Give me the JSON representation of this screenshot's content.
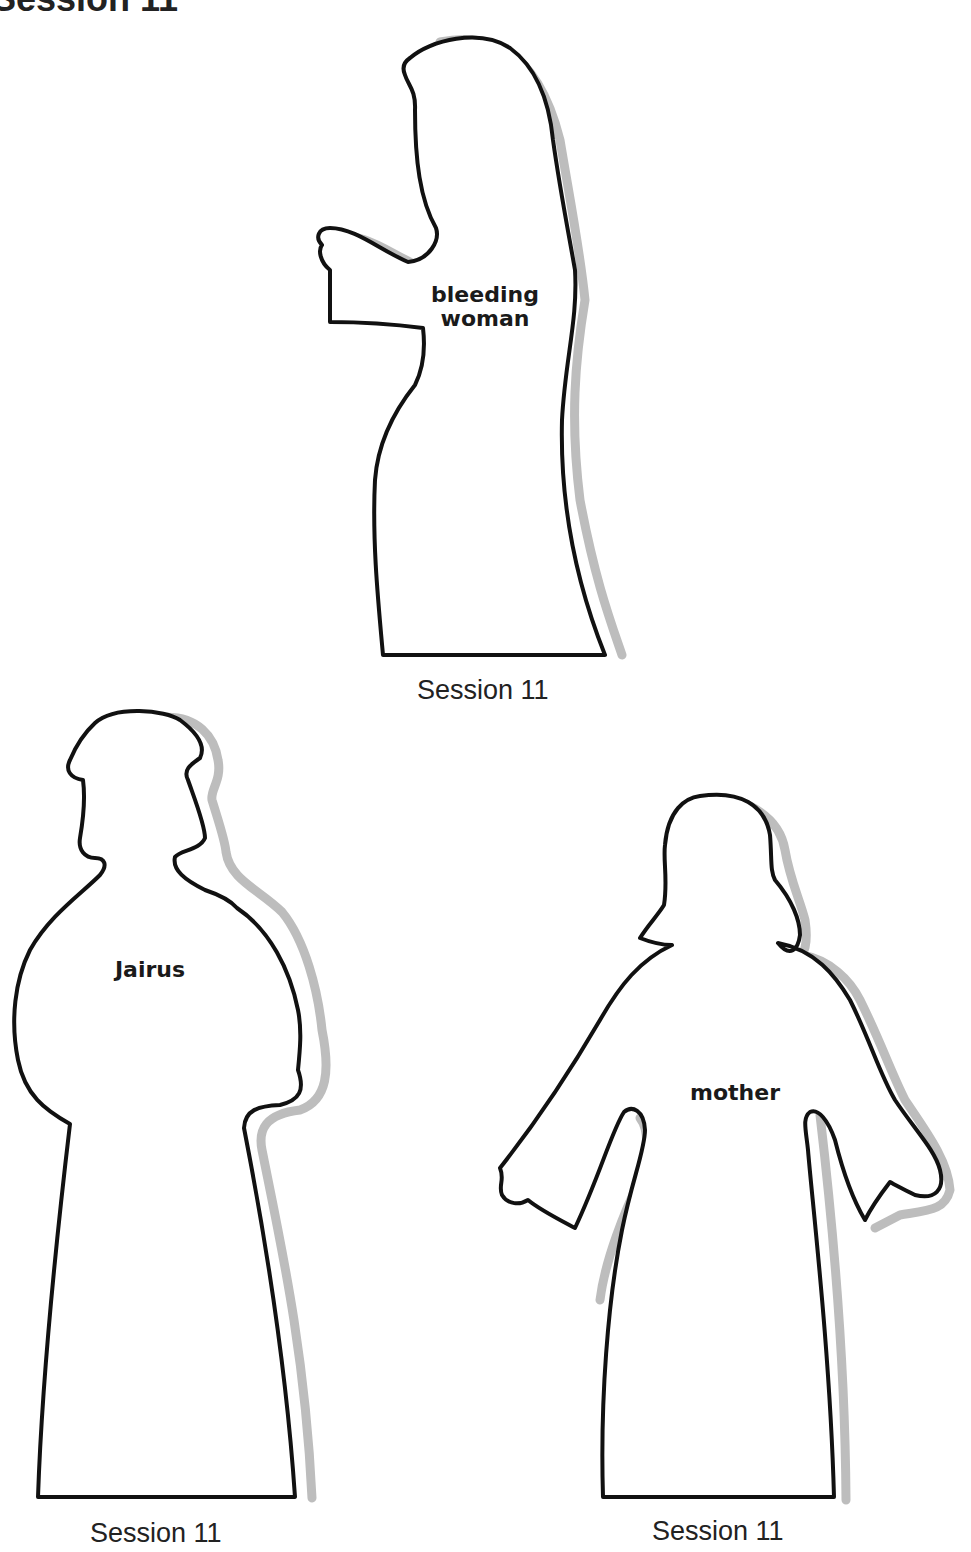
{
  "header": {
    "title": "Session 11"
  },
  "figures": [
    {
      "name": "bleeding-woman",
      "label_lines": [
        "bleeding",
        "woman"
      ],
      "caption": "Session 11"
    },
    {
      "name": "jairus",
      "label_lines": [
        "Jairus"
      ],
      "caption": "Session 11"
    },
    {
      "name": "mother",
      "label_lines": [
        "mother"
      ],
      "caption": "Session 11"
    }
  ],
  "colors": {
    "outline": "#111111",
    "shadow": "#bdbdbd",
    "background": "#ffffff"
  }
}
